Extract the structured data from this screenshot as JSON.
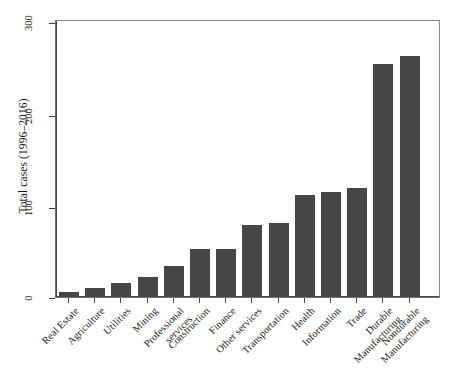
{
  "chart_data": {
    "type": "bar",
    "title": "",
    "xlabel": "",
    "ylabel": "Total cases (1996–2016)",
    "ylim": [
      0,
      310
    ],
    "yticks": [
      0,
      100,
      200,
      300
    ],
    "ytick_labels": [
      "0",
      "100",
      "200",
      "300"
    ],
    "grid": false,
    "legend": "none",
    "bar_color": "#464646",
    "categories": [
      "Real Estate",
      "Agriculture",
      "Utilities",
      "Mining",
      "Professional services",
      "Construction",
      "Finance",
      "Other services",
      "Transportation",
      "Health",
      "Information",
      "Trade",
      "Durable Manufacturing",
      "Nondurable Manufacturing"
    ],
    "values": [
      4,
      9,
      14,
      21,
      33,
      51,
      51,
      77,
      80,
      110,
      114,
      118,
      253,
      262
    ]
  },
  "axes": {
    "y_title": "Total cases (1996–2016)",
    "y_tick_0": "0",
    "y_tick_1": "100",
    "y_tick_2": "200",
    "y_tick_3": "300"
  },
  "labels": {
    "c0": "Real Estate",
    "c1": "Agriculture",
    "c2": "Utilities",
    "c3": "Mining",
    "c4a": "Professional",
    "c4b": "services",
    "c5": "Construction",
    "c6": "Finance",
    "c7": "Other services",
    "c8": "Transportation",
    "c9": "Health",
    "c10": "Information",
    "c11": "Trade",
    "c12a": "Durable",
    "c12b": "Manufacturing",
    "c13a": "Nondurable",
    "c13b": "Manufacturing"
  }
}
